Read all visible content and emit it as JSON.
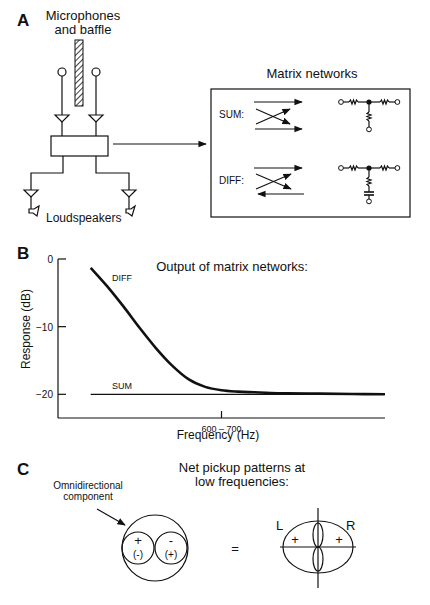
{
  "panel_a": {
    "letter": "A",
    "mic_label_line1": "Microphones",
    "mic_label_line2": "and baffle",
    "speaker_label": "Loudspeakers",
    "matrix_title": "Matrix networks",
    "sum_label": "SUM:",
    "diff_label": "DIFF:"
  },
  "panel_b": {
    "letter": "B",
    "chart_data": {
      "type": "line",
      "title": "Output of matrix networks:",
      "xlabel": "Frequency (Hz)",
      "ylabel": "Response (dB)",
      "x_tick_labels": [
        "600 – 700"
      ],
      "y_ticks": [
        0,
        -10,
        -20
      ],
      "y_tick_labels": [
        "0",
        "-10",
        "-20"
      ],
      "ylim": [
        -23.5,
        0
      ],
      "x_units": "relative frequency (0 = axis start, 1 = axis end); 0.5 ≈ 600–700 Hz",
      "xlim": [
        0,
        1
      ],
      "grid": false,
      "legend": "inline labels",
      "series": [
        {
          "name": "DIFF",
          "x": [
            0.1,
            0.15,
            0.2,
            0.25,
            0.3,
            0.35,
            0.4,
            0.45,
            0.5,
            0.55,
            0.6,
            0.65,
            0.7,
            0.8,
            0.9,
            1.0
          ],
          "values": [
            -1.3,
            -4.0,
            -7.0,
            -10.2,
            -13.2,
            -15.8,
            -17.8,
            -18.9,
            -19.4,
            -19.6,
            -19.7,
            -19.8,
            -19.85,
            -19.9,
            -19.95,
            -20.0
          ]
        },
        {
          "name": "SUM",
          "x": [
            0.1,
            1.0
          ],
          "values": [
            -20.0,
            -20.0
          ]
        }
      ]
    }
  },
  "panel_c": {
    "letter": "C",
    "title_line1": "Net pickup patterns at",
    "title_line2": "low frequencies:",
    "omni_label_line1": "Omnidirectional",
    "omni_label_line2": "component",
    "left_lobe_sign": "+",
    "left_lobe_alt": "(-)",
    "right_lobe_sign": "-",
    "right_lobe_alt": "(+)",
    "equals": "=",
    "label_l": "L",
    "label_r": "R",
    "result_left_sign": "+",
    "result_right_sign": "+"
  }
}
